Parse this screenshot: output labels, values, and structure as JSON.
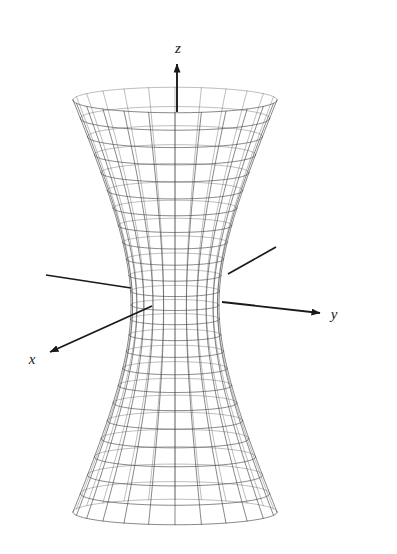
{
  "figure": {
    "title": "",
    "background_color": "#ffffff",
    "width": 397,
    "height": 554
  },
  "axes": [
    {
      "name": "z",
      "label": "z",
      "label_x": 178,
      "label_y": 53,
      "x1": 177,
      "y1": 112,
      "x2": 177,
      "y2": 64,
      "arrow": true,
      "color": "#1a1a1a"
    },
    {
      "name": "y",
      "label": "y",
      "label_x": 334,
      "label_y": 319,
      "x1": 222,
      "y1": 302,
      "x2": 320,
      "y2": 313,
      "arrow": true,
      "color": "#1a1a1a"
    },
    {
      "name": "x",
      "label": "x",
      "label_x": 32,
      "label_y": 364,
      "x1": 152,
      "y1": 306,
      "x2": 50,
      "y2": 352,
      "arrow": true,
      "color": "#1a1a1a"
    }
  ],
  "axes_back_segments": [
    {
      "name": "y-negative-back",
      "x1": 131,
      "y1": 288,
      "x2": 46,
      "y2": 275,
      "color": "#1a1a1a"
    },
    {
      "name": "x-negative-back",
      "x1": 228,
      "y1": 274,
      "x2": 276,
      "y2": 247,
      "color": "#1a1a1a"
    }
  ],
  "chart_data": {
    "type": "surface-wireframe",
    "surface": "hyperboloid-of-one-sheet",
    "equation": "x^2 + y^2 - z^2 = 1",
    "title": "",
    "xlabel": "x",
    "ylabel": "y",
    "zlabel": "z",
    "legend": [],
    "grid": true,
    "projection": {
      "center_x": 175,
      "center_y": 305,
      "waist_radius_px": 44,
      "top_radius_px": 102,
      "bottom_radius_px": 108,
      "top_y": 100,
      "bottom_y": 512,
      "ellipse_flatten": 0.125
    },
    "mesh": {
      "meridians": 24,
      "rings": 24,
      "z_min": -1.9,
      "z_max": 1.9,
      "line_color": "#4a4a4a",
      "line_width": 0.7
    },
    "annotations": [
      {
        "text": "z",
        "x": 178,
        "y": 53
      },
      {
        "text": "y",
        "x": 334,
        "y": 319
      },
      {
        "text": "x",
        "x": 32,
        "y": 364
      }
    ]
  }
}
